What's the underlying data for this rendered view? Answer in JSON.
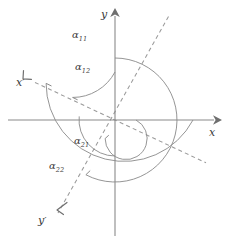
{
  "figure": {
    "type": "geometry-diagram",
    "background_color": "#ffffff",
    "line_color": "#8a8a8a",
    "dash_color": "#9a9a9a",
    "text_color": "#3a3a3a"
  },
  "axes": {
    "origin": {
      "x": 115,
      "y": 120
    },
    "x_axis": {
      "label": "x",
      "label_position": {
        "x": 212,
        "y": 134
      },
      "from": {
        "x": 8,
        "y": 120
      },
      "to": {
        "x": 218,
        "y": 120
      },
      "arrow": "right"
    },
    "y_axis": {
      "label": "y",
      "label_position": {
        "x": 104,
        "y": 17
      },
      "from": {
        "x": 115,
        "y": 236
      },
      "to": {
        "x": 115,
        "y": 12
      },
      "arrow": "up"
    },
    "x_prime_axis": {
      "label": "x",
      "prime": "′",
      "label_position": {
        "x": 17,
        "y": 84
      },
      "angle_deg": 152,
      "arrow": "up-left",
      "style": "dashed"
    },
    "y_prime_axis": {
      "label": "y",
      "prime": "′",
      "label_position": {
        "x": 41,
        "y": 221
      },
      "angle_deg": 242,
      "arrow": "down-left",
      "style": "dashed"
    }
  },
  "angles": [
    {
      "id": "alpha-11",
      "base": "α",
      "subscript": "11",
      "label_position": {
        "x": 78,
        "y": 37
      },
      "arc_radius": 78,
      "arc_from_deg": 0,
      "arc_to_deg": 152,
      "description": "angle from positive x-axis to x-prime axis"
    },
    {
      "id": "alpha-12",
      "base": "α",
      "subscript": "12",
      "label_position": {
        "x": 80,
        "y": 69
      },
      "arc_radius": 48,
      "arc_from_deg": 90,
      "arc_to_deg": 152,
      "description": "angle from positive y-axis to x-prime axis"
    },
    {
      "id": "alpha-21",
      "base": "α",
      "subscript": "21",
      "label_position": {
        "x": 80,
        "y": 142
      },
      "arc_radius": 36,
      "arc_from_deg": 0,
      "arc_to_deg": 242,
      "description": "angle from positive x-axis to y-prime axis"
    },
    {
      "id": "alpha-22",
      "base": "α",
      "subscript": "22",
      "label_position": {
        "x": 55,
        "y": 167
      },
      "arc_radius": 62,
      "arc_from_deg": 90,
      "arc_to_deg": 242,
      "description": "angle from positive y-axis to y-prime axis"
    }
  ]
}
